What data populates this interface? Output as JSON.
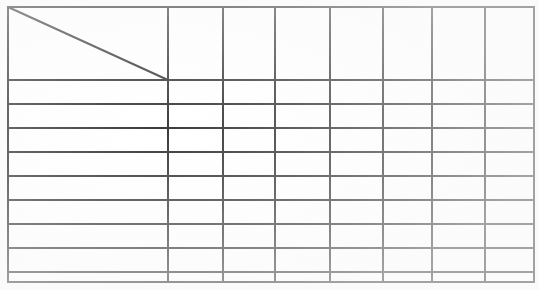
{
  "document": {
    "kind": "blank-table-grid",
    "background_color": "#fdfdfd",
    "line_color": "#3a3a3a",
    "width": 539,
    "height": 290
  },
  "table": {
    "caption": "",
    "column_count": 8,
    "row_count": 10,
    "outer_border": {
      "left": 8,
      "top": 7,
      "right": 534,
      "bottom": 282,
      "stroke_width": 2
    },
    "column_edges": [
      8,
      168,
      223,
      275,
      330,
      383,
      432,
      485,
      534
    ],
    "row_edges": [
      7,
      80,
      104,
      128,
      152,
      176,
      200,
      224,
      248,
      272,
      282
    ],
    "header_row": {
      "height": 73,
      "has_diagonal_split": true,
      "diagonal": {
        "from_x": 8,
        "from_y": 7,
        "to_x": 168,
        "to_y": 80,
        "stroke_width": 2
      },
      "corner_label_upper": "",
      "corner_label_lower": "",
      "cells": [
        "",
        "",
        "",
        "",
        "",
        "",
        "",
        ""
      ]
    },
    "column_headers": [
      "",
      "",
      "",
      "",
      "",
      "",
      "",
      ""
    ],
    "row_headers": [
      "",
      "",
      "",
      "",
      "",
      "",
      "",
      "",
      ""
    ],
    "body_rows": [
      {
        "cells": [
          "",
          "",
          "",
          "",
          "",
          "",
          "",
          ""
        ]
      },
      {
        "cells": [
          "",
          "",
          "",
          "",
          "",
          "",
          "",
          ""
        ]
      },
      {
        "cells": [
          "",
          "",
          "",
          "",
          "",
          "",
          "",
          ""
        ]
      },
      {
        "cells": [
          "",
          "",
          "",
          "",
          "",
          "",
          "",
          ""
        ]
      },
      {
        "cells": [
          "",
          "",
          "",
          "",
          "",
          "",
          "",
          ""
        ]
      },
      {
        "cells": [
          "",
          "",
          "",
          "",
          "",
          "",
          "",
          ""
        ]
      },
      {
        "cells": [
          "",
          "",
          "",
          "",
          "",
          "",
          "",
          ""
        ]
      },
      {
        "cells": [
          "",
          "",
          "",
          "",
          "",
          "",
          "",
          ""
        ]
      },
      {
        "cells": [
          "",
          "",
          "",
          "",
          "",
          "",
          "",
          ""
        ]
      }
    ]
  }
}
